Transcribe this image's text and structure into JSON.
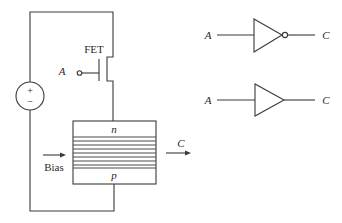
{
  "diagram": {
    "title": "",
    "circuit": {
      "fet_label": "FET",
      "gate_input_label": "A",
      "source_plus": "+",
      "source_minus": "−",
      "junction_top_label": "n",
      "junction_bottom_label": "p",
      "bias_label": "Bias",
      "output_label": "C",
      "stripe_count": 9
    },
    "logic_gates": [
      {
        "type": "inverter",
        "input_label": "A",
        "output_label": "C"
      },
      {
        "type": "buffer",
        "input_label": "A",
        "output_label": "C"
      }
    ],
    "colors": {
      "line": "#3a3a3a",
      "text": "#2a2a2a",
      "background": "#ffffff"
    }
  }
}
